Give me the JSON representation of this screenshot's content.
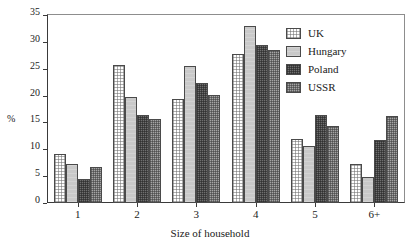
{
  "chart_data": {
    "type": "bar",
    "title": "",
    "subtitle": "",
    "xlabel": "Size of household",
    "ylabel": "%",
    "categories": [
      "1",
      "2",
      "3",
      "4",
      "5",
      "6+"
    ],
    "series": [
      {
        "name": "UK",
        "values": [
          9.2,
          25.7,
          19.3,
          27.7,
          12.0,
          7.2
        ]
      },
      {
        "name": "Hungary",
        "values": [
          7.3,
          19.8,
          25.5,
          33.0,
          10.7,
          4.9
        ]
      },
      {
        "name": "Poland",
        "values": [
          4.4,
          16.3,
          22.3,
          29.5,
          16.3,
          11.8
        ]
      },
      {
        "name": "USSR",
        "values": [
          6.7,
          15.7,
          20.2,
          28.5,
          14.3,
          16.2
        ]
      }
    ],
    "ylim": [
      0,
      35
    ],
    "ytick_values": [
      0,
      5,
      10,
      15,
      20,
      25,
      30,
      35
    ],
    "ytick_labels": [
      "0",
      "5",
      "10",
      "15",
      "20",
      "25",
      "30",
      "35"
    ],
    "grid": false,
    "legend_position": "top-right",
    "legend_entries": [
      "UK",
      "Hungary",
      "Poland",
      "USSR"
    ],
    "annotations": []
  },
  "axes": {
    "y_title": "%",
    "x_title": "Size of household"
  },
  "legend": {
    "items": [
      {
        "label": "UK",
        "pattern": "dotted-white"
      },
      {
        "label": "Hungary",
        "pattern": "solid-light-gray"
      },
      {
        "label": "Poland",
        "pattern": "checker-dark-gray"
      },
      {
        "label": "USSR",
        "pattern": "checker-mid-gray"
      }
    ]
  }
}
